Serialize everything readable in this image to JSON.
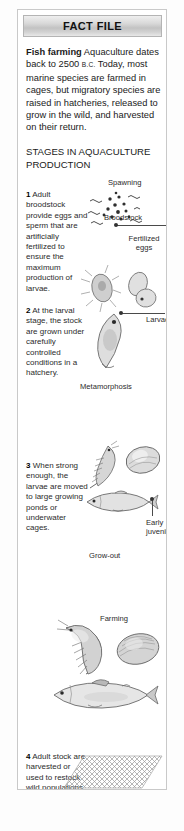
{
  "panel": {
    "header_title": "FACT FILE",
    "intro": {
      "lead": "Fish farming",
      "body_before_era": " Aquaculture dates back to 2500 ",
      "era": "B.C.",
      "body_after_era": " Today, most marine species are farmed in cages, but migratory species are raised in hatcheries, released to grow in the wild, and harvested on their return."
    },
    "section_heading": "STAGES IN AQUACULTURE PRODUCTION",
    "steps": [
      {
        "number": "1",
        "text": " Adult broodstock provide eggs and sperm that are artificially fertilized to ensure the maximum production of larvae."
      },
      {
        "number": "2",
        "text": " At the larval stage, the stock are grown under carefully controlled conditions in a hatchery."
      },
      {
        "number": "3",
        "text": " When strong enough, the larvae are moved to large growing ponds or underwater cages."
      },
      {
        "number": "4",
        "text": " Adult stock are harvested or used to restock wild populations."
      }
    ],
    "diagram_labels": {
      "spawning": "Spawning",
      "broodstock": "Broodstock",
      "fertilized_eggs": "Fertilized eggs",
      "larvae": "Larvae",
      "metamorphosis": "Metamorphosis",
      "early_juveniles": "Early juveniles",
      "grow_out": "Grow-out",
      "farming": "Farming"
    },
    "illustrations": [
      "eggs-and-sperm-illustration",
      "larva-and-eggs-illustration",
      "larval-fish-illustration",
      "juvenile-shrimp-illustration",
      "juvenile-oyster-illustration",
      "juvenile-fish-illustration",
      "adult-shrimp-illustration",
      "adult-oyster-illustration",
      "adult-salmon-illustration",
      "fishing-net-illustration"
    ],
    "colors": {
      "header_bg": "#c2c2c2",
      "panel_border": "#c9c9c9",
      "text": "#1a1a1a",
      "leader_line": "#4a4a4a"
    }
  }
}
